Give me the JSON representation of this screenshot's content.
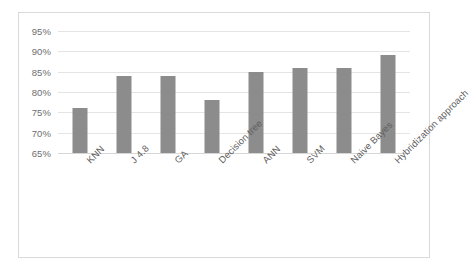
{
  "chart_data": {
    "type": "bar",
    "title": "",
    "subtitle": "",
    "xlabel": "",
    "ylabel": "",
    "categories": [
      "KNN",
      "J 4.8",
      "GA",
      "Decision tree",
      "ANN",
      "SVM",
      "Naive Bayes",
      "Hybridization approach"
    ],
    "values": [
      76,
      84,
      84,
      78,
      85,
      86,
      86,
      89
    ],
    "value_suffix": "%",
    "ylim": [
      65,
      95
    ],
    "ytick_labels": [
      "95%",
      "90%",
      "85%",
      "80%",
      "75%",
      "70%",
      "65%"
    ],
    "ytick_values": [
      95,
      90,
      85,
      80,
      75,
      70,
      65
    ],
    "grid": true,
    "legend": false,
    "legend_position": "none",
    "bar_color": "#8c8c8c",
    "gridline_color": "#e4e4e4",
    "axis_text_color": "#6e6e6e",
    "frame_border_color": "#d9d9d9",
    "background_color": "#ffffff",
    "xlabel_rotation_degrees": -45
  }
}
